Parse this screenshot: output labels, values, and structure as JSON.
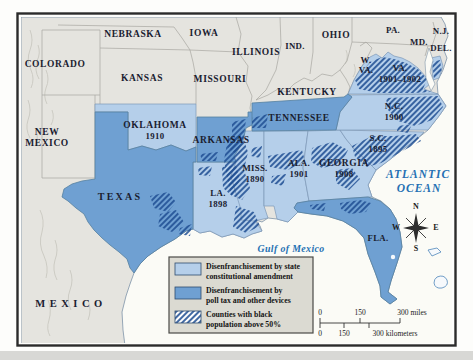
{
  "region_labels": {
    "colorado": "COLORADO",
    "new_mexico_line1": "NEW",
    "new_mexico_line2": "MEXICO",
    "nebraska": "NEBRASKA",
    "iowa": "IOWA",
    "kansas": "KANSAS",
    "missouri": "MISSOURI",
    "illinois": "ILLINOIS",
    "indiana": "IND.",
    "ohio": "OHIO",
    "kentucky": "KENTUCKY",
    "west_virginia_line1": "W.",
    "west_virginia_line2": "VA.",
    "pennsylvania": "PA.",
    "maryland": "MD.",
    "delaware": "DEL.",
    "new_jersey": "N.J.",
    "mexico": "MEXICO"
  },
  "disenfranchised_states": {
    "oklahoma": {
      "name": "OKLAHOMA",
      "year": "1910"
    },
    "texas": {
      "name": "TEXAS"
    },
    "arkansas": {
      "name": "ARKANSAS"
    },
    "louisiana": {
      "name": "LA.",
      "year": "1898"
    },
    "mississippi": {
      "name": "MISS.",
      "year": "1890"
    },
    "alabama": {
      "name": "ALA.",
      "year": "1901"
    },
    "tennessee": {
      "name": "TENNESSEE"
    },
    "georgia": {
      "name": "GEORGIA",
      "year": "1908"
    },
    "florida": {
      "name": "FLA."
    },
    "south_carolina": {
      "name": "S.C.",
      "year": "1895"
    },
    "north_carolina": {
      "name": "N.C.",
      "year": "1900"
    },
    "virginia": {
      "name": "VA.",
      "year": "1901–1902"
    }
  },
  "water_labels": {
    "gulf": "Gulf of Mexico",
    "atlantic_line1": "ATLANTIC",
    "atlantic_line2": "OCEAN"
  },
  "compass": {
    "north": "N",
    "east": "E",
    "south": "S",
    "west": "W"
  },
  "legend": {
    "items": [
      {
        "line1": "Disenfranchisement by state",
        "line2": "constitutional amendment"
      },
      {
        "line1": "Disenfranchisement by",
        "line2": "poll tax and other devices"
      },
      {
        "line1": "Counties with black",
        "line2": "population above 50%"
      }
    ]
  },
  "scale_bar": {
    "miles": {
      "zero": "0",
      "mid": "150",
      "end": "300 miles"
    },
    "kilometers": {
      "zero": "0",
      "mid": "150",
      "end": "300 kilometers"
    }
  },
  "colors": {
    "amendment_blue": "#b5cfea",
    "poll_tax_blue": "#6fa0d2",
    "hatch_blue": "#1f4f93",
    "water_label_blue": "#2470b3",
    "land_gray": "#e5e4df",
    "ocean_white": "#fbfbf6",
    "legend_bg": "#dbdad2"
  }
}
